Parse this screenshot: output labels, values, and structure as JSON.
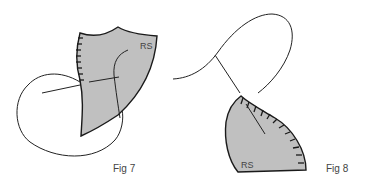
{
  "figures": [
    {
      "id": "fig7",
      "caption": "Fig 7",
      "fabric_label": "RS"
    },
    {
      "id": "fig8",
      "caption": "Fig 8",
      "fabric_label": "RS"
    }
  ],
  "colors": {
    "fabric_fill": "#c0c0c0",
    "outline": "#1a1a1a",
    "thread": "#222222",
    "text": "#444444"
  }
}
